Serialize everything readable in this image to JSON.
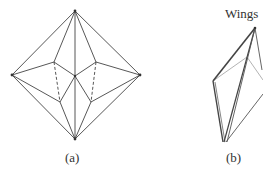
{
  "figure": {
    "panels": [
      {
        "id": "a",
        "caption": "(a)",
        "vertices": {
          "top": [
            75,
            11
          ],
          "left": [
            12,
            75
          ],
          "right": [
            140,
            75
          ],
          "bottom": [
            75,
            139
          ],
          "center": [
            75,
            76
          ],
          "inner_left_upper": [
            54,
            62
          ],
          "inner_left_lower": [
            60,
            102
          ],
          "inner_right_upper": [
            96,
            62
          ],
          "inner_right_lower": [
            91,
            102
          ]
        }
      },
      {
        "id": "b",
        "caption": "(b)",
        "annotation": "Wings",
        "vertices": {
          "top": [
            255,
            28
          ],
          "left": [
            213,
            81
          ],
          "inner": [
            247,
            57
          ],
          "bottom": [
            225,
            142
          ],
          "right_exit": [
            263,
            92
          ]
        }
      }
    ],
    "colors": {
      "line": "#444444",
      "line_light": "#9a9a9a",
      "text": "#333333"
    }
  }
}
